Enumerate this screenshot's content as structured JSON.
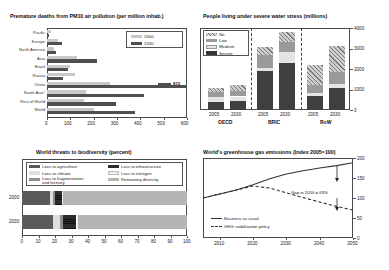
{
  "charts": {
    "pm10": {
      "title": "Premature deaths from PM10 air pollution (per million inhab.)",
      "legend": [
        {
          "label": "2000"
        },
        {
          "label": "2030"
        }
      ],
      "annotation_872": "872",
      "xticks": [
        "0",
        "100",
        "200",
        "300",
        "400",
        "500",
        "600"
      ],
      "chart_data": {
        "type": "bar",
        "title": "Premature deaths from PM10 air pollution (per million inhab.)",
        "orientation": "horizontal",
        "categories": [
          "Pacific",
          "Europe",
          "North America",
          "Asia",
          "Brazil",
          "Russia",
          "China",
          "South Asia*",
          "Rest of World",
          "World"
        ],
        "series": [
          {
            "name": "2000",
            "values": [
              18,
              45,
              30,
              128,
              98,
              118,
              268,
              168,
              160,
              200
            ]
          },
          {
            "name": "2030",
            "values": [
              8,
              62,
              38,
              215,
              88,
              70,
              872,
              415,
              295,
              378
            ]
          }
        ],
        "xlabel": "",
        "ylabel": "",
        "xlim": [
          0,
          600
        ],
        "annotations": [
          {
            "text": "872",
            "category": "China",
            "series": "2030"
          }
        ],
        "grid": false,
        "legend_position": "top-right"
      }
    },
    "water": {
      "title": "People living under severe water stress (millions)",
      "legend": [
        {
          "label": "No"
        },
        {
          "label": "Low"
        },
        {
          "label": "Medium"
        },
        {
          "label": "Severe"
        }
      ],
      "yticks": [
        "0",
        "1000",
        "2000",
        "3000",
        "4000"
      ],
      "groups": [
        {
          "name": "OECD",
          "years": [
            "2005",
            "2030"
          ]
        },
        {
          "name": "BRIC",
          "years": [
            "2005",
            "2030"
          ]
        },
        {
          "name": "RoW",
          "years": [
            "2005",
            "2030"
          ]
        }
      ],
      "chart_data": {
        "type": "bar",
        "subtype": "stacked",
        "title": "People living under severe water stress (millions)",
        "categories": [
          "OECD 2005",
          "OECD 2030",
          "BRIC 2005",
          "BRIC 2030",
          "RoW 2005",
          "RoW 2030"
        ],
        "series": [
          {
            "name": "Severe",
            "values": [
              400,
              420,
              1880,
              2280,
              700,
              1080
            ]
          },
          {
            "name": "Medium",
            "values": [
              230,
              240,
              180,
              560,
              140,
              190
            ]
          },
          {
            "name": "Low",
            "values": [
              230,
              280,
              600,
              470,
              390,
              560
            ]
          },
          {
            "name": "No",
            "values": [
              230,
              270,
              390,
              500,
              950,
              1290
            ]
          }
        ],
        "xlabel": "",
        "ylabel": "millions",
        "ylim": [
          0,
          4000
        ],
        "grid": false,
        "legend_position": "top-left"
      }
    },
    "biodiversity": {
      "title": "World threats to biodiversity (percent)",
      "legend_left": [
        {
          "label": "Loss to agriculture"
        },
        {
          "label": "Loss to climate"
        },
        {
          "label": "Loss to fragmentation and forestry"
        }
      ],
      "legend_right": [
        {
          "label": "Loss to infrastructure"
        },
        {
          "label": "Loss to nitrogen"
        },
        {
          "label": "Remaining diversity"
        }
      ],
      "rowlabels": [
        "2000",
        "2030"
      ],
      "xticks": [
        "0",
        "10",
        "20",
        "30",
        "40",
        "50",
        "60",
        "70",
        "80",
        "90",
        "100"
      ],
      "chart_data": {
        "type": "bar",
        "subtype": "stacked-100",
        "title": "World threats to biodiversity (percent)",
        "orientation": "horizontal",
        "categories": [
          "2000",
          "2030"
        ],
        "series": [
          {
            "name": "Loss to agriculture",
            "values": [
              17,
              19
            ]
          },
          {
            "name": "Loss to climate",
            "values": [
              2,
              4
            ]
          },
          {
            "name": "Loss to fragmentation and forestry",
            "values": [
              1,
              2
            ]
          },
          {
            "name": "Loss to infrastructure",
            "values": [
              4,
              8
            ]
          },
          {
            "name": "Loss to nitrogen",
            "values": [
              1,
              1
            ]
          },
          {
            "name": "Remaining diversity",
            "values": [
              75,
              66
            ]
          }
        ],
        "xlabel": "percent",
        "ylabel": "",
        "xlim": [
          0,
          100
        ],
        "grid": false
      }
    },
    "ghg": {
      "title": "World's greenhouse gas emissions (Index 2005=100)",
      "legend": [
        {
          "label": "Business as usual"
        },
        {
          "label": "GHG stabilisation policy"
        }
      ],
      "annotation": "Gap in 2050 = 63%",
      "xticks": [
        "2010",
        "2020",
        "2030",
        "2040",
        "2050"
      ],
      "yticks": [
        "0",
        "50",
        "100",
        "150",
        "200"
      ],
      "chart_data": {
        "type": "line",
        "title": "World's greenhouse gas emissions (Index 2005=100)",
        "x": [
          2005,
          2010,
          2015,
          2020,
          2025,
          2030,
          2035,
          2040,
          2045,
          2050
        ],
        "series": [
          {
            "name": "Business as usual",
            "values": [
              100,
              110,
              120,
              133,
              148,
              160,
              168,
              175,
              181,
              188
            ],
            "style": "solid"
          },
          {
            "name": "GHG stabilisation policy",
            "values": [
              100,
              110,
              120,
              130,
              125,
              113,
              101,
              90,
              79,
              70
            ],
            "style": "dashed"
          }
        ],
        "xlabel": "",
        "ylabel": "Index 2005=100",
        "ylim": [
          0,
          200
        ],
        "xlim": [
          2005,
          2050
        ],
        "annotations": [
          {
            "text": "Gap in 2050 = 63%",
            "x": 2048
          }
        ],
        "grid": false,
        "legend_position": "bottom-left"
      }
    }
  },
  "colors": {
    "light_gray": "#c9c9c9",
    "mid_gray": "#8a8a8a",
    "dark_gray": "#4f4f4f",
    "very_dark": "#3a3a3a",
    "near_black": "#2b2b2b",
    "pale": "#e2e2e2"
  }
}
